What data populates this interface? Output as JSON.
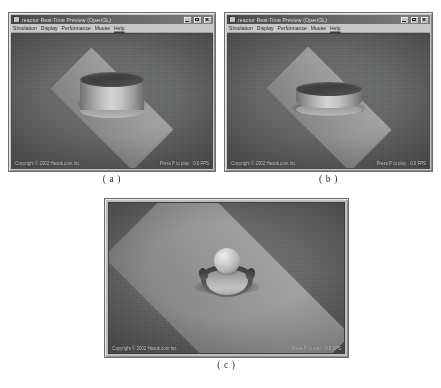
{
  "figure": {
    "panels": [
      {
        "id": "a",
        "caption": "( a )",
        "window": {
          "title": "reactor Real-Time Preview (OpenGL)",
          "icon": "app-icon",
          "buttons": [
            {
              "name": "minimize",
              "glyph": "_"
            },
            {
              "name": "maximize",
              "glyph": "□"
            },
            {
              "name": "close",
              "glyph": "×"
            }
          ],
          "menu": [
            "Simulation",
            "Display",
            "Performance",
            "Mouse",
            "Help"
          ]
        },
        "status": {
          "left": "Copyright © 2002 Havok.com Inc.",
          "mid": "Press P to play",
          "right": "0.0 FPS"
        },
        "scene": {
          "description": "rigid cylinder resting above ground plane",
          "objects": [
            "cylinder",
            "ground-plane"
          ]
        }
      },
      {
        "id": "b",
        "caption": "( b )",
        "window": {
          "title": "reactor Real-Time Preview (OpenGL)",
          "icon": "app-icon",
          "buttons": [
            {
              "name": "minimize",
              "glyph": "_"
            },
            {
              "name": "maximize",
              "glyph": "□"
            },
            {
              "name": "close",
              "glyph": "×"
            }
          ],
          "menu": [
            "Simulation",
            "Display",
            "Performance",
            "Mouse",
            "Help"
          ]
        },
        "status": {
          "left": "Copyright © 2002 Havok.com Inc.",
          "mid": "Press P to play",
          "right": "0.0 FPS"
        },
        "scene": {
          "description": "deformed soft-body cylinder flattened on ground plane",
          "objects": [
            "cylinder",
            "ground-plane"
          ]
        }
      },
      {
        "id": "c",
        "caption": "( c )",
        "window": {
          "title": "",
          "icon": "",
          "buttons": [],
          "menu": []
        },
        "status": {
          "left": "Copyright © 2002 Havok.com Inc.",
          "mid": "Press P to play",
          "right": "0.0 FPS"
        },
        "scene": {
          "description": "sphere impacting dented soft body on large ground plane",
          "objects": [
            "sphere",
            "soft-body",
            "ground-plane"
          ]
        }
      }
    ]
  },
  "colors": {
    "viewport_background": "#5e5f62",
    "ground_plane": "#9a9a97",
    "body_highlight": "#d2d2cd",
    "body_shadow": "#3e3f43",
    "window_frame": "#c4c4c2",
    "titlebar": "#4a4a56",
    "status_text": "#cfd0cd"
  }
}
